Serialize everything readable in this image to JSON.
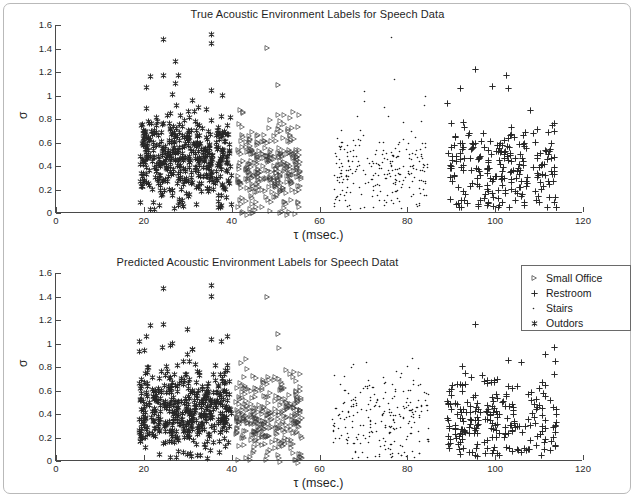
{
  "figure": {
    "xlabel": "τ (msec.)",
    "ylabel": "σ",
    "xticks": [
      "0",
      "20",
      "40",
      "60",
      "80",
      "100",
      "120"
    ],
    "yticks": [
      "0",
      "0.2",
      "0.4",
      "0.6",
      "0.8",
      "1",
      "1.2",
      "1.4",
      "1.6"
    ]
  },
  "panels": {
    "true": {
      "title": "True Acoustic Environment Labels for Speech Data"
    },
    "predicted": {
      "title": "Predicted Acoustic Environment Labels for Speech Datat"
    }
  },
  "legend": {
    "items": [
      {
        "label": "Small Office",
        "marker": "triangle-right-icon"
      },
      {
        "label": "Restroom",
        "marker": "plus-icon"
      },
      {
        "label": "Stairs",
        "marker": "dot-icon"
      },
      {
        "label": "Outdors",
        "marker": "star-icon"
      }
    ]
  },
  "chart_data": {
    "type": "scatter",
    "title": "True Acoustic Environment Labels for Speech Data",
    "xlabel": "τ (msec.)",
    "ylabel": "σ",
    "xlim": [
      0,
      120
    ],
    "ylim": [
      0,
      1.6
    ],
    "xticks": [
      0,
      20,
      40,
      60,
      80,
      100,
      120
    ],
    "yticks": [
      0,
      0.2,
      0.4,
      0.6,
      0.8,
      1,
      1.2,
      1.4,
      1.6
    ],
    "grid": false,
    "legend_position": "right-of-lower-panel",
    "subplots": [
      {
        "name": "true",
        "title": "True Acoustic Environment Labels for Speech Data",
        "series": [
          {
            "name": "Outdors",
            "marker": "star",
            "color": "#262626",
            "x_range": [
              19,
              40
            ],
            "y_range": [
              0.08,
              1.58
            ],
            "n_points": 430,
            "cluster_center": [
              28.5,
              0.5
            ]
          },
          {
            "name": "Small Office",
            "marker": "triangle-right",
            "color": "#3a3a3a",
            "x_range": [
              41,
              56
            ],
            "y_range": [
              0.05,
              1.47
            ],
            "n_points": 300,
            "cluster_center": [
              46.5,
              0.42
            ]
          },
          {
            "name": "Stairs",
            "marker": "dot",
            "color": "#1a1a1a",
            "x_range": [
              63,
              85
            ],
            "y_range": [
              0.1,
              1.57
            ],
            "n_points": 240,
            "cluster_center": [
              75,
              0.42
            ]
          },
          {
            "name": "Restroom",
            "marker": "plus",
            "color": "#262626",
            "x_range": [
              89,
              114
            ],
            "y_range": [
              0.1,
              1.28
            ],
            "n_points": 230,
            "cluster_center": [
              101,
              0.42
            ]
          }
        ]
      },
      {
        "name": "predicted",
        "title": "Predicted Acoustic Environment Labels for Speech Datat",
        "series": [
          {
            "name": "Outdors",
            "marker": "star",
            "color": "#262626",
            "x_range": [
              19,
              40
            ],
            "y_range": [
              0.08,
              1.55
            ],
            "n_points": 420,
            "cluster_center": [
              28.5,
              0.5
            ]
          },
          {
            "name": "Small Office",
            "marker": "triangle-right",
            "color": "#3a3a3a",
            "x_range": [
              41,
              56
            ],
            "y_range": [
              0.05,
              1.46
            ],
            "n_points": 295,
            "cluster_center": [
              46.5,
              0.42
            ]
          },
          {
            "name": "Stairs",
            "marker": "dot",
            "color": "#1a1a1a",
            "x_range": [
              63,
              85
            ],
            "y_range": [
              0.1,
              0.95
            ],
            "n_points": 235,
            "cluster_center": [
              75,
              0.42
            ]
          },
          {
            "name": "Restroom",
            "marker": "plus",
            "color": "#262626",
            "x_range": [
              89,
              114
            ],
            "y_range": [
              0.1,
              1.22
            ],
            "n_points": 225,
            "cluster_center": [
              101,
              0.42
            ]
          }
        ]
      }
    ]
  }
}
